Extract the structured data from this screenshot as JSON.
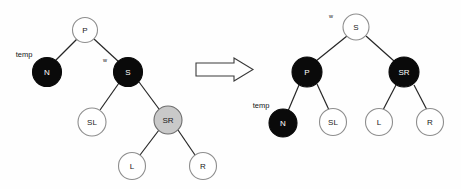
{
  "diagram": {
    "background_color": "#fefefe",
    "colors": {
      "black_node_fill": "#0a0a0a",
      "white_node_fill": "#ffffff",
      "gray_node_fill": "#c9c9c9",
      "node_stroke_light": "#8e8e8e",
      "edge_stroke": "#262626",
      "label_text": "#161616"
    },
    "transition_arrow": {
      "name": "rightwards-block-arrow",
      "direction": "right",
      "x": 196,
      "y": 58,
      "width": 57,
      "height": 23
    },
    "left_tree": {
      "caption": "before",
      "nodes": [
        {
          "id": "P",
          "label": "P",
          "color": "white",
          "cx": 85,
          "cy": 30,
          "r": 12.5,
          "text_color": "dark"
        },
        {
          "id": "N",
          "label": "N",
          "color": "black",
          "cx": 47,
          "cy": 72,
          "r": 14.5,
          "text_color": "light"
        },
        {
          "id": "S",
          "label": "S",
          "color": "black",
          "cx": 128,
          "cy": 72,
          "r": 14.5,
          "text_color": "light"
        },
        {
          "id": "SL",
          "label": "SL",
          "color": "white",
          "cx": 92,
          "cy": 122,
          "r": 14.0,
          "text_color": "dark"
        },
        {
          "id": "SR",
          "label": "SR",
          "color": "gray",
          "cx": 168,
          "cy": 120,
          "r": 14.0,
          "text_color": "dark"
        },
        {
          "id": "L",
          "label": "L",
          "color": "white",
          "cx": 132,
          "cy": 166,
          "r": 13.5,
          "text_color": "dark"
        },
        {
          "id": "R",
          "label": "R",
          "color": "white",
          "cx": 203,
          "cy": 166,
          "r": 13.5,
          "text_color": "dark"
        }
      ],
      "edges": [
        {
          "from": "P",
          "to": "N"
        },
        {
          "from": "P",
          "to": "S"
        },
        {
          "from": "S",
          "to": "SL"
        },
        {
          "from": "S",
          "to": "SR"
        },
        {
          "from": "SR",
          "to": "L"
        },
        {
          "from": "SR",
          "to": "R"
        }
      ],
      "annotations": [
        {
          "id": "temp-left",
          "text": "temp",
          "x": 24,
          "y": 54,
          "size": "normal",
          "points_to": "N"
        },
        {
          "id": "w-left",
          "text": "w",
          "x": 105,
          "y": 60,
          "size": "small",
          "points_to": "S"
        }
      ]
    },
    "right_tree": {
      "caption": "after",
      "nodes": [
        {
          "id": "S",
          "label": "S",
          "color": "white",
          "cx": 356,
          "cy": 27,
          "r": 13.0,
          "text_color": "dark"
        },
        {
          "id": "P",
          "label": "P",
          "color": "black",
          "cx": 307,
          "cy": 72,
          "r": 15.0,
          "text_color": "light"
        },
        {
          "id": "SR",
          "label": "SR",
          "color": "black",
          "cx": 404,
          "cy": 72,
          "r": 15.0,
          "text_color": "light"
        },
        {
          "id": "N",
          "label": "N",
          "color": "black",
          "cx": 283,
          "cy": 123,
          "r": 14.0,
          "text_color": "light"
        },
        {
          "id": "SL",
          "label": "SL",
          "color": "white",
          "cx": 333,
          "cy": 122,
          "r": 13.5,
          "text_color": "dark"
        },
        {
          "id": "L",
          "label": "L",
          "color": "white",
          "cx": 379,
          "cy": 122,
          "r": 13.5,
          "text_color": "dark"
        },
        {
          "id": "R",
          "label": "R",
          "color": "white",
          "cx": 430,
          "cy": 122,
          "r": 13.5,
          "text_color": "dark"
        }
      ],
      "edges": [
        {
          "from": "S",
          "to": "P"
        },
        {
          "from": "S",
          "to": "SR"
        },
        {
          "from": "P",
          "to": "N"
        },
        {
          "from": "P",
          "to": "SL"
        },
        {
          "from": "SR",
          "to": "L"
        },
        {
          "from": "SR",
          "to": "R"
        }
      ],
      "annotations": [
        {
          "id": "w-right",
          "text": "w",
          "x": 331,
          "y": 16,
          "size": "small",
          "points_to": "S"
        },
        {
          "id": "temp-right",
          "text": "temp",
          "x": 261,
          "y": 105,
          "size": "normal",
          "points_to": "N"
        }
      ]
    }
  }
}
